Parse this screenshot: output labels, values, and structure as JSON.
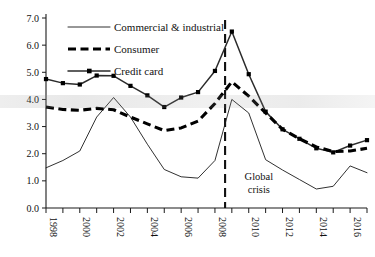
{
  "chart_data": {
    "type": "line",
    "title": "",
    "subtitle": "",
    "xlabel": "",
    "ylabel": "",
    "xlim": [
      1998,
      2017
    ],
    "ylim": [
      0.0,
      7.0
    ],
    "grid": false,
    "legend_position": "top-center",
    "x": [
      1998,
      1999,
      2000,
      2001,
      2002,
      2003,
      2004,
      2005,
      2006,
      2007,
      2008,
      2009,
      2010,
      2011,
      2012,
      2013,
      2014,
      2015,
      2016,
      2017
    ],
    "ytick_labels": [
      "0.0",
      "1.0",
      "2.0",
      "3.0",
      "4.0",
      "5.0",
      "6.0",
      "7.0"
    ],
    "ytick_values": [
      0.0,
      1.0,
      2.0,
      3.0,
      4.0,
      5.0,
      6.0,
      7.0
    ],
    "xtick_labels": [
      "1998",
      "2000",
      "2002",
      "2004",
      "2006",
      "2008",
      "2010",
      "2012",
      "2014",
      "2016"
    ],
    "xtick_values": [
      1998,
      2000,
      2002,
      2004,
      2006,
      2008,
      2010,
      2012,
      2014,
      2016
    ],
    "xtick_minor_values": [
      1999,
      2001,
      2003,
      2005,
      2007,
      2009,
      2011,
      2013,
      2015,
      2017
    ],
    "series": [
      {
        "name": "Commercial & industrial",
        "style": "thin-solid",
        "color": "#1a1a1a",
        "markers": false,
        "values": [
          1.48,
          1.75,
          2.1,
          3.35,
          4.07,
          3.35,
          2.35,
          1.42,
          1.15,
          1.1,
          1.75,
          4.0,
          3.5,
          1.78,
          1.4,
          1.05,
          0.7,
          0.8,
          1.55,
          1.3
        ]
      },
      {
        "name": "Consumer",
        "style": "thick-dashed",
        "color": "#000000",
        "markers": false,
        "values": [
          3.72,
          3.63,
          3.6,
          3.67,
          3.62,
          3.35,
          3.1,
          2.85,
          2.95,
          3.2,
          3.85,
          4.65,
          4.12,
          3.5,
          2.9,
          2.55,
          2.25,
          2.08,
          2.1,
          2.2
        ]
      },
      {
        "name": "Credit card",
        "style": "solid-square-markers",
        "color": "#2b2b2b",
        "markers": true,
        "values": [
          4.75,
          4.6,
          4.55,
          4.88,
          4.87,
          4.5,
          4.15,
          3.72,
          4.07,
          4.27,
          5.05,
          6.5,
          4.93,
          3.55,
          2.9,
          2.55,
          2.2,
          2.05,
          2.3,
          2.5
        ]
      }
    ],
    "annotations": [
      {
        "name": "global-crisis",
        "line1": "Global",
        "line2": "crisis",
        "x": 2010.6,
        "y": 1.05,
        "marker_line_x": 2008.6
      }
    ]
  }
}
